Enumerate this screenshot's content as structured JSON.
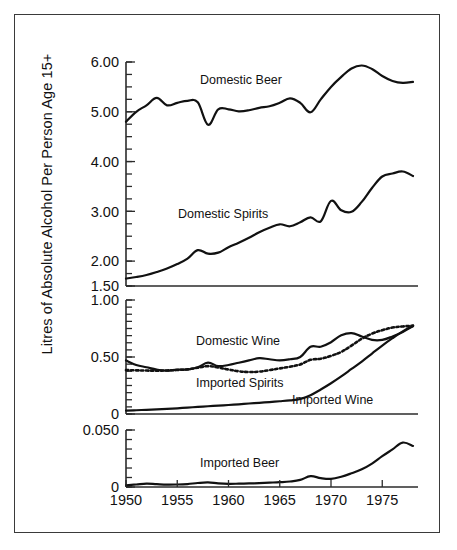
{
  "figure": {
    "ylabel": "Litres of Absolute Alcohol Per Person Age 15+",
    "frame": true
  },
  "chart_data": {
    "type": "line",
    "title": "",
    "xlabel": "",
    "ylabel": "Litres of Absolute Alcohol Per Person Age 15+",
    "grid": false,
    "legend": "inline-annotations",
    "x": [
      1950,
      1951,
      1952,
      1953,
      1954,
      1955,
      1956,
      1957,
      1958,
      1959,
      1960,
      1961,
      1962,
      1963,
      1964,
      1965,
      1966,
      1967,
      1968,
      1969,
      1970,
      1971,
      1972,
      1973,
      1974,
      1975,
      1976,
      1977,
      1978
    ],
    "xlim": [
      1950,
      1978
    ],
    "xticks": [
      1950,
      1955,
      1960,
      1965,
      1970,
      1975
    ],
    "xticklabels": [
      "1950",
      "1955",
      "1960",
      "1965",
      "1970",
      "1975"
    ],
    "panels": [
      {
        "name": "top",
        "ylim": [
          1.5,
          6.0
        ],
        "yticks": [
          1.5,
          2.0,
          3.0,
          4.0,
          5.0,
          6.0
        ],
        "yticklabels": [
          "1.50",
          "2.00",
          "3.00",
          "4.00",
          "5.00",
          "6.00"
        ],
        "minor_tick_step": 0.25,
        "series": [
          {
            "name": "Domestic Beer",
            "style": "solid",
            "label": "Domestic Beer",
            "values": [
              4.8,
              5.0,
              5.13,
              5.28,
              5.13,
              5.18,
              5.22,
              5.19,
              4.74,
              5.05,
              5.05,
              5.01,
              5.03,
              5.08,
              5.11,
              5.18,
              5.27,
              5.18,
              4.99,
              5.25,
              5.5,
              5.7,
              5.87,
              5.93,
              5.86,
              5.72,
              5.62,
              5.58,
              5.6
            ]
          },
          {
            "name": "Domestic Spirits",
            "style": "solid",
            "label": "Domestic Spirits",
            "values": [
              1.65,
              1.68,
              1.72,
              1.78,
              1.85,
              1.94,
              2.05,
              2.22,
              2.15,
              2.17,
              2.28,
              2.37,
              2.47,
              2.58,
              2.67,
              2.74,
              2.7,
              2.78,
              2.88,
              2.8,
              3.21,
              3.02,
              2.99,
              3.19,
              3.47,
              3.7,
              3.76,
              3.8,
              3.71
            ]
          }
        ]
      },
      {
        "name": "middle",
        "ylim": [
          0,
          1.0
        ],
        "yticks": [
          0,
          0.5,
          1.0
        ],
        "yticklabels": [
          "0",
          "0.50",
          "1.00"
        ],
        "minor_tick_step": 0.0625,
        "series": [
          {
            "name": "Domestic Wine",
            "style": "solid",
            "label": "Domestic Wine",
            "values": [
              0.47,
              0.43,
              0.41,
              0.39,
              0.38,
              0.39,
              0.39,
              0.41,
              0.45,
              0.42,
              0.43,
              0.45,
              0.47,
              0.49,
              0.48,
              0.47,
              0.48,
              0.5,
              0.59,
              0.59,
              0.63,
              0.69,
              0.71,
              0.68,
              0.65,
              0.65,
              0.68,
              0.72,
              0.77
            ]
          },
          {
            "name": "Imported Spirits",
            "style": "dotted",
            "label": "Imported Spirits",
            "values": [
              0.385,
              0.383,
              0.381,
              0.38,
              0.382,
              0.386,
              0.392,
              0.406,
              0.42,
              0.408,
              0.39,
              0.375,
              0.368,
              0.372,
              0.385,
              0.4,
              0.415,
              0.435,
              0.475,
              0.485,
              0.51,
              0.545,
              0.6,
              0.66,
              0.705,
              0.735,
              0.758,
              0.768,
              0.775
            ]
          },
          {
            "name": "Imported Wine",
            "style": "solid",
            "label": "Imported Wine",
            "values": [
              0.03,
              0.033,
              0.037,
              0.041,
              0.045,
              0.05,
              0.056,
              0.062,
              0.068,
              0.073,
              0.079,
              0.085,
              0.092,
              0.098,
              0.105,
              0.112,
              0.12,
              0.132,
              0.165,
              0.215,
              0.27,
              0.33,
              0.395,
              0.46,
              0.53,
              0.6,
              0.665,
              0.725,
              0.775
            ]
          }
        ]
      },
      {
        "name": "bottom",
        "ylim": [
          0,
          0.05
        ],
        "yticks": [
          0,
          0.05
        ],
        "yticklabels": [
          "0",
          "0.050"
        ],
        "minor_tick_step": 0.00833,
        "series": [
          {
            "name": "Imported Beer",
            "style": "solid",
            "label": "Imported Beer",
            "values": [
              0.0015,
              0.0022,
              0.003,
              0.0025,
              0.0021,
              0.0022,
              0.0026,
              0.0035,
              0.004,
              0.0032,
              0.0028,
              0.0029,
              0.0031,
              0.0034,
              0.0038,
              0.0042,
              0.0048,
              0.0062,
              0.0095,
              0.0078,
              0.0072,
              0.009,
              0.012,
              0.0155,
              0.0205,
              0.027,
              0.033,
              0.039,
              0.036
            ]
          }
        ]
      }
    ]
  }
}
